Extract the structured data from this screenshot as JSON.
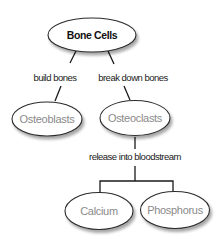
{
  "diagram": {
    "type": "concept-map",
    "colors": {
      "background": "#ffffff",
      "node_stroke": "#2b2b2b",
      "root_text": "#111111",
      "node_text": "#8a8a8a",
      "edge": "#1a1a1a"
    },
    "nodes": {
      "bone_cells": {
        "label": "Bone Cells"
      },
      "osteoblasts": {
        "label": "Osteoblasts"
      },
      "osteoclasts": {
        "label": "Osteoclasts"
      },
      "calcium": {
        "label": "Calcium"
      },
      "phosphorus": {
        "label": "Phosphorus"
      }
    },
    "edges": {
      "build": {
        "from": "Bone Cells",
        "to": "Osteoblasts",
        "label": "build bones"
      },
      "break": {
        "from": "Bone Cells",
        "to": "Osteoclasts",
        "label": "break down bones"
      },
      "release": {
        "from": "Osteoclasts",
        "to": [
          "Calcium",
          "Phosphorus"
        ],
        "label": "release into bloodstream"
      }
    }
  }
}
